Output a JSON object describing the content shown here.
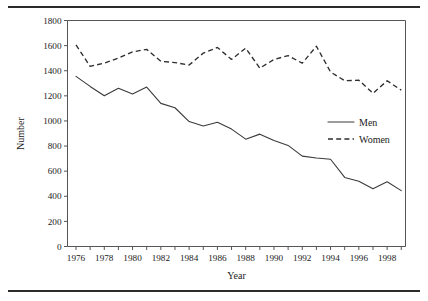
{
  "figure": {
    "top_rule": "horizontal-rule",
    "bottom_rule": "horizontal-rule"
  },
  "chart_data": {
    "type": "line",
    "title": "",
    "xlabel": "Year",
    "ylabel": "Number",
    "xlim": [
      1975.4,
      1999.3
    ],
    "ylim": [
      0,
      1800
    ],
    "ytick_step": 200,
    "yticks": [
      0,
      200,
      400,
      600,
      800,
      1000,
      1200,
      1400,
      1600,
      1800
    ],
    "ytick_labels": [
      "0",
      "200",
      "400",
      "600",
      "800",
      "1000",
      "1200",
      "1400",
      "1600",
      "1800"
    ],
    "xticks": [
      1976,
      1977,
      1978,
      1979,
      1980,
      1981,
      1982,
      1983,
      1984,
      1985,
      1986,
      1987,
      1988,
      1989,
      1990,
      1991,
      1992,
      1993,
      1994,
      1995,
      1996,
      1997,
      1998,
      1999
    ],
    "xtick_labels_shown": [
      "1976",
      "1978",
      "1980",
      "1982",
      "1984",
      "1986",
      "1988",
      "1990",
      "1992",
      "1994",
      "1996",
      "1998"
    ],
    "grid": false,
    "legend_position": "center-right",
    "x": [
      1976,
      1977,
      1978,
      1979,
      1980,
      1981,
      1982,
      1983,
      1984,
      1985,
      1986,
      1987,
      1988,
      1989,
      1990,
      1991,
      1992,
      1993,
      1994,
      1995,
      1996,
      1997,
      1998,
      1999
    ],
    "series": [
      {
        "name": "Men",
        "style": "solid",
        "color": "#3a3a3a",
        "values": [
          1355,
          1275,
          1200,
          1260,
          1215,
          1270,
          1140,
          1105,
          995,
          960,
          990,
          935,
          855,
          895,
          845,
          805,
          720,
          705,
          695,
          550,
          520,
          460,
          515,
          445
        ]
      },
      {
        "name": "Women",
        "style": "dashed",
        "color": "#2e2e2e",
        "values": [
          1605,
          1435,
          1460,
          1500,
          1550,
          1570,
          1475,
          1465,
          1445,
          1540,
          1585,
          1490,
          1580,
          1420,
          1490,
          1520,
          1460,
          1595,
          1390,
          1320,
          1325,
          1220,
          1320,
          1245
        ]
      }
    ]
  },
  "legend": {
    "items": [
      {
        "label": "Men",
        "style": "solid"
      },
      {
        "label": "Women",
        "style": "dashed"
      }
    ]
  }
}
